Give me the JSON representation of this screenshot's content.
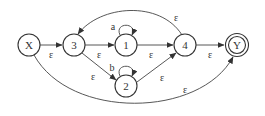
{
  "diagram": {
    "type": "nfa",
    "nodes": [
      {
        "id": "X",
        "label": "X",
        "x": 29,
        "y": 45,
        "accepting": false
      },
      {
        "id": "3",
        "label": "3",
        "x": 74,
        "y": 45,
        "accepting": false
      },
      {
        "id": "1",
        "label": "1",
        "x": 126,
        "y": 45,
        "accepting": false
      },
      {
        "id": "2",
        "label": "2",
        "x": 126,
        "y": 86,
        "accepting": false
      },
      {
        "id": "4",
        "label": "4",
        "x": 185,
        "y": 45,
        "accepting": false
      },
      {
        "id": "Y",
        "label": "Y",
        "x": 237,
        "y": 45,
        "accepting": true
      }
    ],
    "edges": [
      {
        "from": "X",
        "to": "3",
        "label": "ε"
      },
      {
        "from": "3",
        "to": "1",
        "label": "ε"
      },
      {
        "from": "3",
        "to": "2",
        "label": "ε"
      },
      {
        "from": "1",
        "to": "1",
        "label": "a"
      },
      {
        "from": "2",
        "to": "2",
        "label": "b"
      },
      {
        "from": "1",
        "to": "4",
        "label": "ε"
      },
      {
        "from": "2",
        "to": "4",
        "label": "ε"
      },
      {
        "from": "4",
        "to": "3",
        "label": "ε"
      },
      {
        "from": "4",
        "to": "Y",
        "label": "ε"
      },
      {
        "from": "X",
        "to": "Y",
        "label": "ε"
      }
    ]
  }
}
